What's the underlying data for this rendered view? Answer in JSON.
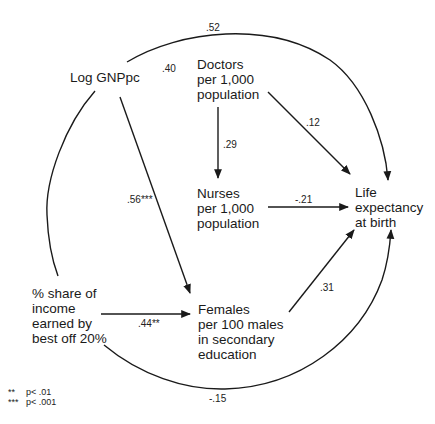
{
  "diagram": {
    "type": "path-diagram",
    "nodes": {
      "log_gnp": {
        "lines": [
          "Log GNPpc"
        ]
      },
      "doctors": {
        "lines": [
          "Doctors",
          "per 1,000",
          "population"
        ]
      },
      "nurses": {
        "lines": [
          "Nurses",
          "per 1,000",
          "population"
        ]
      },
      "life": {
        "lines": [
          "Life",
          "expectancy",
          "at birth"
        ]
      },
      "income_share": {
        "lines": [
          "% share of",
          "income",
          "earned by",
          "best off 20%"
        ]
      },
      "females": {
        "lines": [
          "Females",
          "per 100 males",
          "in secondary",
          "education"
        ]
      }
    },
    "edges": [
      {
        "id": "log_gnp_to_life",
        "from": "Log GNPpc",
        "to": "Life expectancy at birth",
        "coefficient": ".52",
        "style": "curved-arrow"
      },
      {
        "id": "log_gnp_doctors",
        "from": "Log GNPpc",
        "to": "Doctors per 1,000 population",
        "coefficient": ".40",
        "style": "label-only"
      },
      {
        "id": "doctors_to_life",
        "from": "Doctors per 1,000 population",
        "to": "Life expectancy at birth",
        "coefficient": ".12",
        "style": "arrow"
      },
      {
        "id": "doctors_to_nurses",
        "from": "Doctors per 1,000 population",
        "to": "Nurses per 1,000 population",
        "coefficient": ".29",
        "style": "arrow"
      },
      {
        "id": "nurses_to_life",
        "from": "Nurses per 1,000 population",
        "to": "Life expectancy at birth",
        "coefficient": "-.21",
        "style": "arrow"
      },
      {
        "id": "log_gnp_to_females",
        "from": "Log GNPpc",
        "to": "Females per 100 males in secondary education",
        "coefficient": ".56***",
        "style": "arrow"
      },
      {
        "id": "income_to_females",
        "from": "% share of income earned by best off 20%",
        "to": "Females per 100 males in secondary education",
        "coefficient": ".44**",
        "style": "arrow"
      },
      {
        "id": "females_to_life",
        "from": "Females per 100 males in secondary education",
        "to": "Life expectancy at birth",
        "coefficient": ".31",
        "style": "arrow"
      },
      {
        "id": "income_to_life",
        "from": "% share of income earned by best off 20%",
        "to": "Life expectancy at birth",
        "coefficient": "-.15",
        "style": "curved-arrow"
      },
      {
        "id": "log_gnp_income",
        "from": "Log GNPpc",
        "to": "% share of income earned by best off 20%",
        "coefficient": "",
        "style": "curved-line"
      }
    ],
    "legend": [
      {
        "symbol": "**",
        "meaning": "p< .01"
      },
      {
        "symbol": "***",
        "meaning": "p< .001"
      }
    ],
    "line_color": "#1a1a1a"
  }
}
